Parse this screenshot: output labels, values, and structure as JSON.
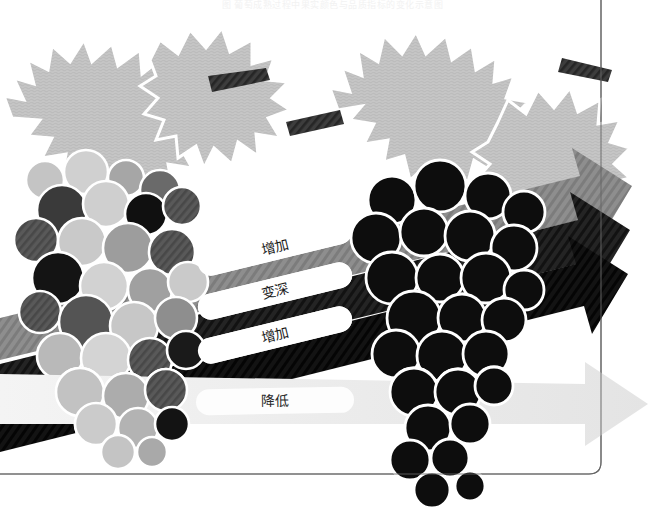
{
  "figure": {
    "title_caption": "图 葡萄成熟过程中果实颜色与品质指标的变化示意图",
    "background_color": "#ffffff",
    "frame_color": "#555555"
  },
  "clusters": [
    {
      "id": "left-cluster",
      "name": "未成熟葡萄串",
      "state": "unripe",
      "berry_colors": [
        "#c9c9c9",
        "#a8a8a8",
        "#6e6e6e",
        "#4a4a4a",
        "#141414"
      ],
      "outline_color": "#ffffff",
      "description": "颜色混杂的葡萄串"
    },
    {
      "id": "right-cluster",
      "name": "成熟葡萄串",
      "state": "ripe",
      "berry_colors": [
        "#0d0d0d"
      ],
      "outline_color": "#ffffff",
      "description": "颜色深黑的成熟葡萄串"
    }
  ],
  "leaves": {
    "fill_color": "#c4c4c4",
    "vein_color": "#ffffff",
    "count": 4
  },
  "stems": {
    "fill_color": "#3a3a3a",
    "count": 3
  },
  "arrows": [
    {
      "index": 0,
      "label": "增加",
      "meaning": "increase",
      "band_color": "#8e8e8e",
      "pill_color": "#ffffff",
      "text_color": "#1a1a1a",
      "direction": "up-right"
    },
    {
      "index": 1,
      "label": "变深",
      "meaning": "darken",
      "band_color": "#1e1e1e",
      "pill_color": "#ffffff",
      "text_color": "#1a1a1a",
      "direction": "up-right"
    },
    {
      "index": 2,
      "label": "增加",
      "meaning": "increase",
      "band_color": "#111111",
      "pill_color": "#ffffff",
      "text_color": "#1a1a1a",
      "direction": "up-right"
    },
    {
      "index": 3,
      "label": "降低",
      "meaning": "decrease",
      "band_color": "#ececec",
      "pill_color": "#fdfdfd",
      "text_color": "#2a2a2a",
      "direction": "right"
    }
  ]
}
